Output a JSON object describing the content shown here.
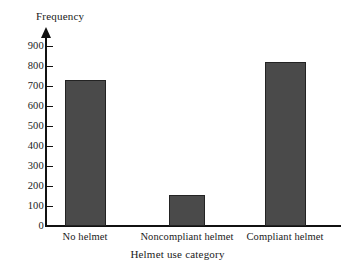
{
  "chart_data": {
    "type": "bar",
    "title": "",
    "xlabel": "Helmet use category",
    "ylabel": "Frequency",
    "categories": [
      "No helmet",
      "Noncompliant helmet",
      "Compliant helmet"
    ],
    "values": [
      730,
      155,
      820
    ],
    "ylim": [
      0,
      900
    ],
    "yticks": [
      0,
      100,
      200,
      300,
      400,
      500,
      600,
      700,
      800,
      900
    ],
    "ytick_labels": [
      "0",
      "100",
      "200",
      "300",
      "400",
      "500",
      "600",
      "700",
      "800",
      "900"
    ],
    "grid": false,
    "legend": null,
    "bar_color": "#4a4a4a",
    "bar_edge_color": "#232323",
    "axis_color": "#111111",
    "background_color": "#ffffff"
  }
}
